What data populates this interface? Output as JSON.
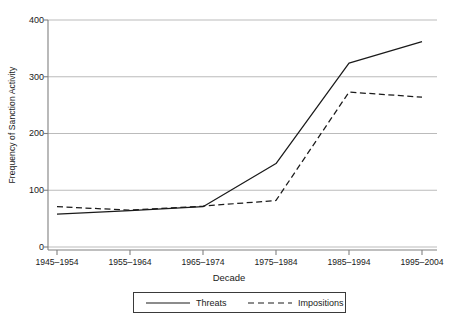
{
  "chart_data": {
    "type": "line",
    "title": "",
    "xlabel": "Decade",
    "ylabel": "Frequency of Sanction Activity",
    "categories": [
      "1945–1954",
      "1955–1964",
      "1965–1974",
      "1975–1984",
      "1985–1994",
      "1995–2004"
    ],
    "series": [
      {
        "name": "Threats",
        "style": "solid",
        "values": [
          58,
          64,
          71,
          147,
          324,
          362
        ]
      },
      {
        "name": "Impositions",
        "style": "dashed",
        "values": [
          71,
          65,
          72,
          82,
          273,
          264
        ]
      }
    ],
    "ylim": [
      0,
      400
    ],
    "yticks": [
      0,
      100,
      200,
      300,
      400
    ],
    "ytick_labels": [
      "0",
      "100",
      "200",
      "300",
      "400"
    ],
    "grid": "horizontal",
    "legend_position": "below-axis",
    "colors": {
      "line": "#1a1a1a",
      "grid": "#b3b3b3",
      "axis": "#808080",
      "background": "#ffffff"
    }
  }
}
